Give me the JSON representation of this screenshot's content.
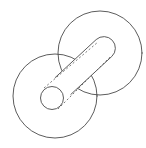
{
  "figure": {
    "title": "Two overlapping circles with diagonal rounded slot and small bore",
    "background_color": "#ffffff",
    "stroke_color": "#4a4a4a",
    "dashed_stroke_color": "#5a5a5a",
    "width": 146,
    "height": 148
  },
  "shapes": {
    "upper_right_circle": {
      "label": "upper-right-disc",
      "cx": 100,
      "cy": 53,
      "r": 42
    },
    "lower_left_circle": {
      "label": "lower-left-disc",
      "cx": 55,
      "cy": 96,
      "r": 42
    },
    "small_bore_circle": {
      "label": "small-bore",
      "cx": 52,
      "cy": 98,
      "r": 11.5
    },
    "slot": {
      "label": "diagonal-rounded-slot",
      "start_x": 63,
      "start_y": 86,
      "end_x": 104,
      "end_y": 48,
      "half_width": 11.5,
      "rounded_end": "upper-right"
    },
    "dashed_line_upper": {
      "label": "upper-tangent-construction-line",
      "x1": 44,
      "y1": 88,
      "x2": 98,
      "y2": 42
    },
    "dashed_line_lower": {
      "label": "lower-tangent-construction-line",
      "x1": 58,
      "y1": 109,
      "x2": 110,
      "y2": 57
    }
  }
}
